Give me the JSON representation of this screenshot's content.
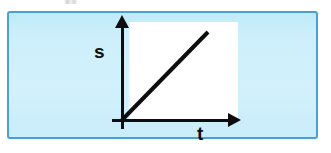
{
  "figure": {
    "name": "distance-time-graph",
    "frame": {
      "border_color": "#4a9fd4",
      "fill_color": "#cdeffb"
    },
    "plot_panel": {
      "background_color": "#ffffff"
    },
    "axes": {
      "line_color": "#0d0d0d",
      "y_axis": {
        "label": "s",
        "icon": "arrow-up-icon",
        "direction": "up"
      },
      "x_axis": {
        "label": "t",
        "icon": "arrow-right-icon",
        "direction": "right"
      },
      "origin_label": ""
    },
    "top_artifact": {
      "description": "faint cropped text remnant"
    }
  },
  "chart_data": {
    "type": "line",
    "title": "",
    "xlabel": "t",
    "ylabel": "s",
    "xlim": [
      0,
      1
    ],
    "ylim": [
      0,
      1
    ],
    "grid": false,
    "legend": "none",
    "annotations": [],
    "series": [
      {
        "name": "s = v·t",
        "x": [
          0,
          1
        ],
        "y": [
          0,
          1
        ],
        "color": "#0d0d0d",
        "style": "solid",
        "width": 4
      }
    ],
    "xticks": [],
    "yticks": [],
    "xticklabels": [],
    "yticklabels": []
  }
}
